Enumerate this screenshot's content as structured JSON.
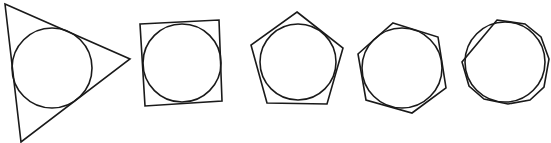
{
  "diagram": {
    "stroke_color": "#1a1a1a",
    "background": "#ffffff",
    "figures": [
      {
        "name": "triangle",
        "sides": 3,
        "polygon_points": "5,4 130,59 21,142",
        "circle": {
          "cx": 52,
          "cy": 68,
          "r": 40
        }
      },
      {
        "name": "square",
        "sides": 4,
        "polygon_points": "140,24 219,20 222,101 145,106",
        "circle": {
          "cx": 182,
          "cy": 63,
          "r": 39
        }
      },
      {
        "name": "pentagon",
        "sides": 5,
        "polygon_points": "297,12 343,48 327,104 267,103 251,45",
        "circle": {
          "cx": 298,
          "cy": 62,
          "r": 38
        }
      },
      {
        "name": "hexagon",
        "sides": 6,
        "polygon_points": "393,23 438,37 446,88 412,113 366,100 358,54",
        "circle": {
          "cx": 402,
          "cy": 68,
          "r": 40
        }
      },
      {
        "name": "decagon",
        "sides": 10,
        "polygon_points": "497,20 525,24 541,37 549,59 544,87 530,100 508,104 484,99 469,86 462,62",
        "circle": {
          "cx": 505,
          "cy": 62,
          "r": 40
        }
      }
    ]
  }
}
